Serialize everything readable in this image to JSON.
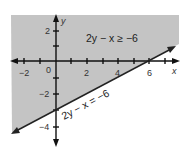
{
  "graph": {
    "region": {
      "fill": "#c4c4c4",
      "label": "2y − x ≥ −6",
      "description": "shaded half-plane above the boundary line"
    },
    "boundary": {
      "label": "2y − x = −6",
      "color": "#222222",
      "x_intercept": 6,
      "y_intercept": -3
    },
    "axes": {
      "x_label": "x",
      "y_label": "y",
      "origin_label": "0",
      "x_tick_labels": [
        "−2",
        "2",
        "4",
        "6"
      ],
      "y_tick_labels": [
        "2",
        "−2",
        "−4"
      ],
      "color": "#111111"
    }
  }
}
